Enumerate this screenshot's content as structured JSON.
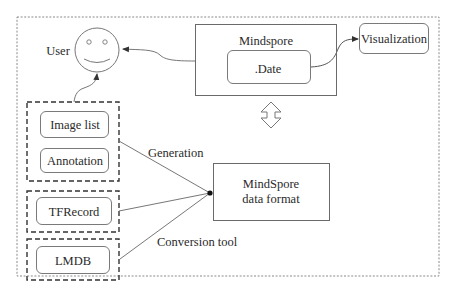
{
  "diagram": {
    "type": "architecture-flow",
    "frame": {
      "style": "dotted"
    },
    "nodes": {
      "user": {
        "label": "User",
        "icon": "smiley-face-icon"
      },
      "mindspore": {
        "label": "Mindspore",
        "inner": {
          "label": ".Date"
        }
      },
      "visualization": {
        "label": "Visualization"
      },
      "data_format": {
        "line1": "MindSpore",
        "line2": "data format"
      },
      "sources": {
        "group1": {
          "items": [
            "Image list",
            "Annotation"
          ]
        },
        "group2": {
          "items": [
            "TFRecord"
          ]
        },
        "group3": {
          "items": [
            "LMDB"
          ]
        }
      }
    },
    "edges": {
      "generation": "Generation",
      "conversion": "Conversion tool"
    },
    "colors": {
      "stroke": "#6a6a6a",
      "text": "#2a2a2a",
      "background": "#ffffff"
    }
  }
}
